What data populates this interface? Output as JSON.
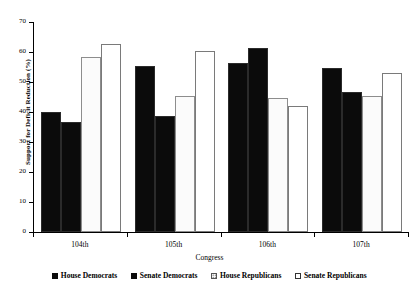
{
  "chart_data": {
    "type": "bar",
    "title": "",
    "xlabel": "Congress",
    "ylabel": "Support for Deficit Reduction (%)",
    "categories": [
      "104th",
      "105th",
      "106th",
      "107th"
    ],
    "ylim": [
      0,
      70
    ],
    "yticks": [
      0,
      10,
      20,
      30,
      40,
      50,
      60,
      70
    ],
    "grid": false,
    "legend_position": "bottom",
    "series": [
      {
        "name": "House Democrats",
        "fill": "solid-black",
        "values": [
          40.0,
          55.3,
          56.3,
          54.7
        ]
      },
      {
        "name": "Senate Democrats",
        "fill": "solid-black",
        "values": [
          36.7,
          38.7,
          61.3,
          46.7
        ]
      },
      {
        "name": "House Republicans",
        "fill": "dotted",
        "values": [
          58.3,
          45.3,
          44.7,
          45.3
        ]
      },
      {
        "name": "Senate Republicans",
        "fill": "open-white",
        "values": [
          62.7,
          60.3,
          42.0,
          53.0
        ]
      }
    ]
  },
  "axes": {
    "y_tick_labels": [
      "0",
      "10",
      "20",
      "30",
      "40",
      "50",
      "60",
      "70"
    ],
    "x_tick_labels": [
      "104th",
      "105th",
      "106th",
      "107th"
    ],
    "y_title": "Support for Deficit Reduction (%)",
    "x_title": "Congress"
  },
  "legend": {
    "items": [
      {
        "label": "House Democrats",
        "style": "solid"
      },
      {
        "label": "Senate Democrats",
        "style": "solid"
      },
      {
        "label": "House Republicans",
        "style": "dotted"
      },
      {
        "label": "Senate Republicans",
        "style": "open"
      }
    ]
  },
  "colors": {
    "solid_fill": "#0b0b0b",
    "dotted_fill": "#fbfbfb",
    "dotted_dot": "#6f6f6f",
    "open_fill": "#ffffff",
    "axis": "#000000",
    "background": "#ffffff"
  }
}
